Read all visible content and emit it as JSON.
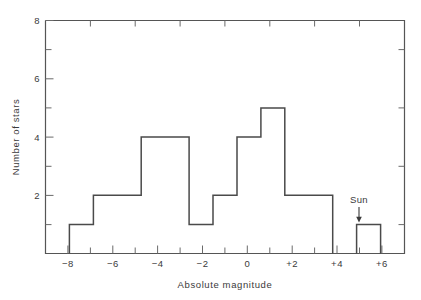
{
  "chart_data": {
    "type": "bar",
    "title": "",
    "subtitle": "",
    "xlabel": "Absolute  magnitude",
    "ylabel": "Number of stars",
    "xlim": [
      -9,
      6
    ],
    "ylim": [
      0,
      8
    ],
    "grid": false,
    "legend": null,
    "x_major_ticks": [
      -8,
      -6,
      -4,
      -2,
      0,
      2,
      4,
      6
    ],
    "x_major_tick_labels": [
      "−8",
      "−6",
      "−4",
      "−2",
      "0",
      "+2",
      "+4",
      "+6"
    ],
    "x_minor_ticks": [
      -7,
      -5,
      -3,
      -1,
      1,
      3,
      5
    ],
    "y_major_ticks": [
      2,
      4,
      6,
      8
    ],
    "y_major_tick_labels": [
      "2",
      "4",
      "6",
      "8"
    ],
    "y_minor_ticks": [
      1,
      3,
      5,
      7
    ],
    "bin_edges": [
      -8,
      -7,
      -5,
      -3,
      -2,
      -1,
      0,
      1,
      3,
      4,
      5
    ],
    "values": [
      1,
      2,
      4,
      1,
      2,
      4,
      5,
      2,
      0,
      1
    ],
    "bins": [
      {
        "from": -8,
        "to": -7,
        "count": 1
      },
      {
        "from": -7,
        "to": -5,
        "count": 2
      },
      {
        "from": -5,
        "to": -3,
        "count": 4
      },
      {
        "from": -3,
        "to": -2,
        "count": 1
      },
      {
        "from": -2,
        "to": -1,
        "count": 2
      },
      {
        "from": -1,
        "to": 0,
        "count": 4
      },
      {
        "from": 0,
        "to": 1,
        "count": 5
      },
      {
        "from": 1,
        "to": 3,
        "count": 2
      },
      {
        "from": 3,
        "to": 4,
        "count": 0
      },
      {
        "from": 4,
        "to": 5,
        "count": 1
      }
    ],
    "annotations": [
      {
        "label": "Sun",
        "x": 4.5,
        "y": 1,
        "arrow": "down"
      }
    ],
    "colors": {
      "line": "#4a4a4a",
      "axis": "#555555",
      "text": "#3a3a3a",
      "background": "#ffffff"
    }
  },
  "figure": {
    "ylabel": "Number of stars",
    "xlabel": "Absolute  magnitude",
    "sun_label": "Sun",
    "y_labels": {
      "t8": "8",
      "t6": "6",
      "t4": "4",
      "t2": "2"
    },
    "x_labels": {
      "m8": "−8",
      "m6": "−6",
      "m4": "−4",
      "m2": "−2",
      "z0": "0",
      "p2": "+2",
      "p4": "+4",
      "p6": "+6"
    }
  }
}
